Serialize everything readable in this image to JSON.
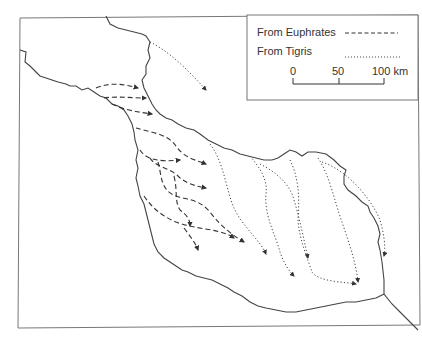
{
  "map": {
    "type": "flow-map",
    "description": "Irrigation canal flows between Euphrates and Tigris rivers"
  },
  "legend": {
    "items": [
      {
        "label": "From Euphrates",
        "style": "dashed"
      },
      {
        "label": "From Tigris",
        "style": "dotted"
      }
    ],
    "scale": {
      "ticks": [
        "0",
        "50",
        "100 km"
      ],
      "unit": "km"
    }
  },
  "colors": {
    "line": "#444444",
    "frame": "#777777",
    "background": "#ffffff"
  }
}
